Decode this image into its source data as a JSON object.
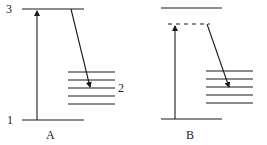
{
  "diagram": {
    "type": "energy-level-diagram",
    "panels": [
      {
        "id": "A",
        "caption": "A",
        "level_labels": {
          "top": "3",
          "bottom": "1",
          "band": "2"
        },
        "transitions": [
          "absorption 1→3",
          "relaxation 3→2"
        ]
      },
      {
        "id": "B",
        "caption": "B",
        "virtual_level": "dashed",
        "transitions": [
          "excitation to virtual level",
          "emission to level band"
        ]
      }
    ],
    "colors": {
      "ink": "#1a1a1a",
      "background": "#ffffff"
    }
  }
}
